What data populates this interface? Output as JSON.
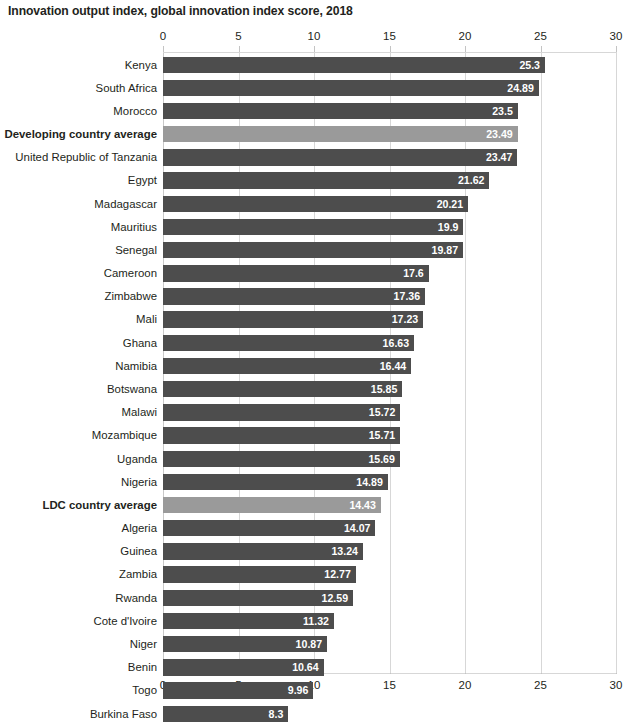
{
  "chart_data": {
    "type": "bar",
    "orientation": "horizontal",
    "title": "Innovation output index, global innovation index score, 2018",
    "xlabel": "",
    "ylabel": "",
    "xlim": [
      0,
      30
    ],
    "xticks": [
      "0",
      "5",
      "10",
      "15",
      "20",
      "25",
      "30"
    ],
    "tick_interval": 5,
    "grid": true,
    "grid_axis": "x",
    "legend": "none",
    "axis_position": "top and bottom",
    "value_labels": "inside bar, right aligned, white bold",
    "colors": {
      "bar_default": "#4d4d4d",
      "bar_highlight": "#9a9a9a",
      "gridline": "#d7d7d7",
      "text": "#231f20",
      "value_text": "#ffffff",
      "background": "#ffffff"
    },
    "categories": [
      "Kenya",
      "South Africa",
      "Morocco",
      "Developing country average",
      "United Republic of Tanzania",
      "Egypt",
      "Madagascar",
      "Mauritius",
      "Senegal",
      "Cameroon",
      "Zimbabwe",
      "Mali",
      "Ghana",
      "Namibia",
      "Botswana",
      "Malawi",
      "Mozambique",
      "Uganda",
      "Nigeria",
      "LDC country average",
      "Algeria",
      "Guinea",
      "Zambia",
      "Rwanda",
      "Cote d'Ivoire",
      "Niger",
      "Benin",
      "Togo",
      "Burkina Faso"
    ],
    "values": [
      25.3,
      24.89,
      23.5,
      23.49,
      23.47,
      21.62,
      20.21,
      19.9,
      19.87,
      17.6,
      17.36,
      17.23,
      16.63,
      16.44,
      15.85,
      15.72,
      15.71,
      15.69,
      14.89,
      14.43,
      14.07,
      13.24,
      12.77,
      12.59,
      11.32,
      10.87,
      10.64,
      9.96,
      8.3
    ],
    "value_labels_text": [
      "25.3",
      "24.89",
      "23.5",
      "23.49",
      "23.47",
      "21.62",
      "20.21",
      "19.9",
      "19.87",
      "17.6",
      "17.36",
      "17.23",
      "16.63",
      "16.44",
      "15.85",
      "15.72",
      "15.71",
      "15.69",
      "14.89",
      "14.43",
      "14.07",
      "13.24",
      "12.77",
      "12.59",
      "11.32",
      "10.87",
      "10.64",
      "9.96",
      "8.3"
    ],
    "highlighted": [
      false,
      false,
      false,
      true,
      false,
      false,
      false,
      false,
      false,
      false,
      false,
      false,
      false,
      false,
      false,
      false,
      false,
      false,
      false,
      true,
      false,
      false,
      false,
      false,
      false,
      false,
      false,
      false,
      false
    ]
  }
}
